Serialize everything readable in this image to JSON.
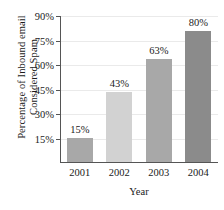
{
  "chart_data": {
    "type": "bar",
    "title": "",
    "xlabel": "Year",
    "ylabel_line1": "Percentage of Inbound email",
    "ylabel_line2": "Considered Spam",
    "categories": [
      "2001",
      "2002",
      "2003",
      "2004"
    ],
    "values": [
      15,
      43,
      63,
      80
    ],
    "value_labels": [
      "15%",
      "43%",
      "63%",
      "80%"
    ],
    "ylim": [
      0,
      90
    ],
    "yticks": [
      15,
      30,
      45,
      60,
      75,
      90
    ],
    "ytick_labels": [
      "15%",
      "30%",
      "45%",
      "60%",
      "75%",
      "90%"
    ],
    "grid": true,
    "legend": false,
    "bar_colors": [
      "#a8a8a8",
      "#d2d2d2",
      "#a8a8a8",
      "#8b8b8b"
    ],
    "axis_color": "#555555",
    "grid_color": "#eaeaea",
    "text_color": "#1a1a1a"
  }
}
